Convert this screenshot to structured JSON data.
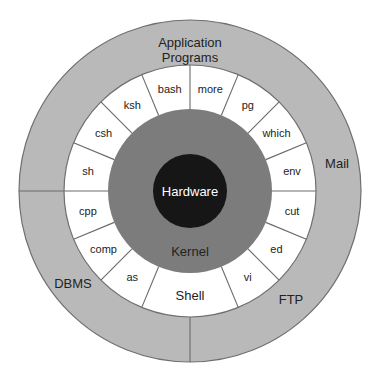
{
  "diagram": {
    "center": [
      190,
      191
    ],
    "colors": {
      "outer_ring": "#b9b9b9",
      "outer_stroke": "#6f6f6f",
      "shell_ring": "#ffffff",
      "segment_stroke": "#6a6a6a",
      "kernel": "#7c7c7c",
      "hardware": "#161616",
      "text_dark": "#222222",
      "text_light": "#ffffff"
    },
    "radii": {
      "outer": 171,
      "shell_outer": 126,
      "kernel": 82,
      "hardware": 37
    },
    "layers": {
      "hardware": {
        "label": "Hardware",
        "x": 190,
        "y": 196
      },
      "kernel": {
        "label": "Kernel",
        "x": 190,
        "y": 256
      },
      "shell": {
        "label": "Shell",
        "x": 190,
        "y": 300
      }
    },
    "shell_segments": [
      {
        "label": "sh",
        "start": 157.5,
        "end": 180,
        "mid": 168.75
      },
      {
        "label": "csh",
        "start": 135,
        "end": 157.5,
        "mid": 146.25
      },
      {
        "label": "ksh",
        "start": 112.5,
        "end": 135,
        "mid": 123.75
      },
      {
        "label": "bash",
        "start": 90,
        "end": 112.5,
        "mid": 101.25
      },
      {
        "label": "more",
        "start": 67.5,
        "end": 90,
        "mid": 78.75
      },
      {
        "label": "pg",
        "start": 45,
        "end": 67.5,
        "mid": 56.25
      },
      {
        "label": "which",
        "start": 22.5,
        "end": 45,
        "mid": 33.75
      },
      {
        "label": "env",
        "start": 0,
        "end": 22.5,
        "mid": 11.25
      },
      {
        "label": "cut",
        "start": -22.5,
        "end": 0,
        "mid": -11.25
      },
      {
        "label": "ed",
        "start": -45,
        "end": -22.5,
        "mid": -33.75
      },
      {
        "label": "vi",
        "start": -67.5,
        "end": -45,
        "mid": -56.25
      },
      {
        "label": "as",
        "start": -135,
        "end": -112.5,
        "mid": -123.75
      },
      {
        "label": "comp",
        "start": -157.5,
        "end": -135,
        "mid": -146.25
      },
      {
        "label": "cpp",
        "start": -180,
        "end": -157.5,
        "mid": -168.75
      }
    ],
    "shell_dividers": [
      180,
      157.5,
      135,
      112.5,
      90,
      67.5,
      45,
      22.5,
      0,
      -22.5,
      -45,
      -67.5,
      -112.5,
      -135,
      -157.5
    ],
    "outer_dividers": [
      180,
      -90
    ],
    "outer_labels": [
      {
        "label": "Application",
        "x": 190,
        "y": 47
      },
      {
        "label": "Programs",
        "x": 190,
        "y": 62
      },
      {
        "label": "Mail",
        "x": 337,
        "y": 168
      },
      {
        "label": "FTP",
        "x": 291,
        "y": 304
      },
      {
        "label": "DBMS",
        "x": 73,
        "y": 288
      }
    ]
  }
}
